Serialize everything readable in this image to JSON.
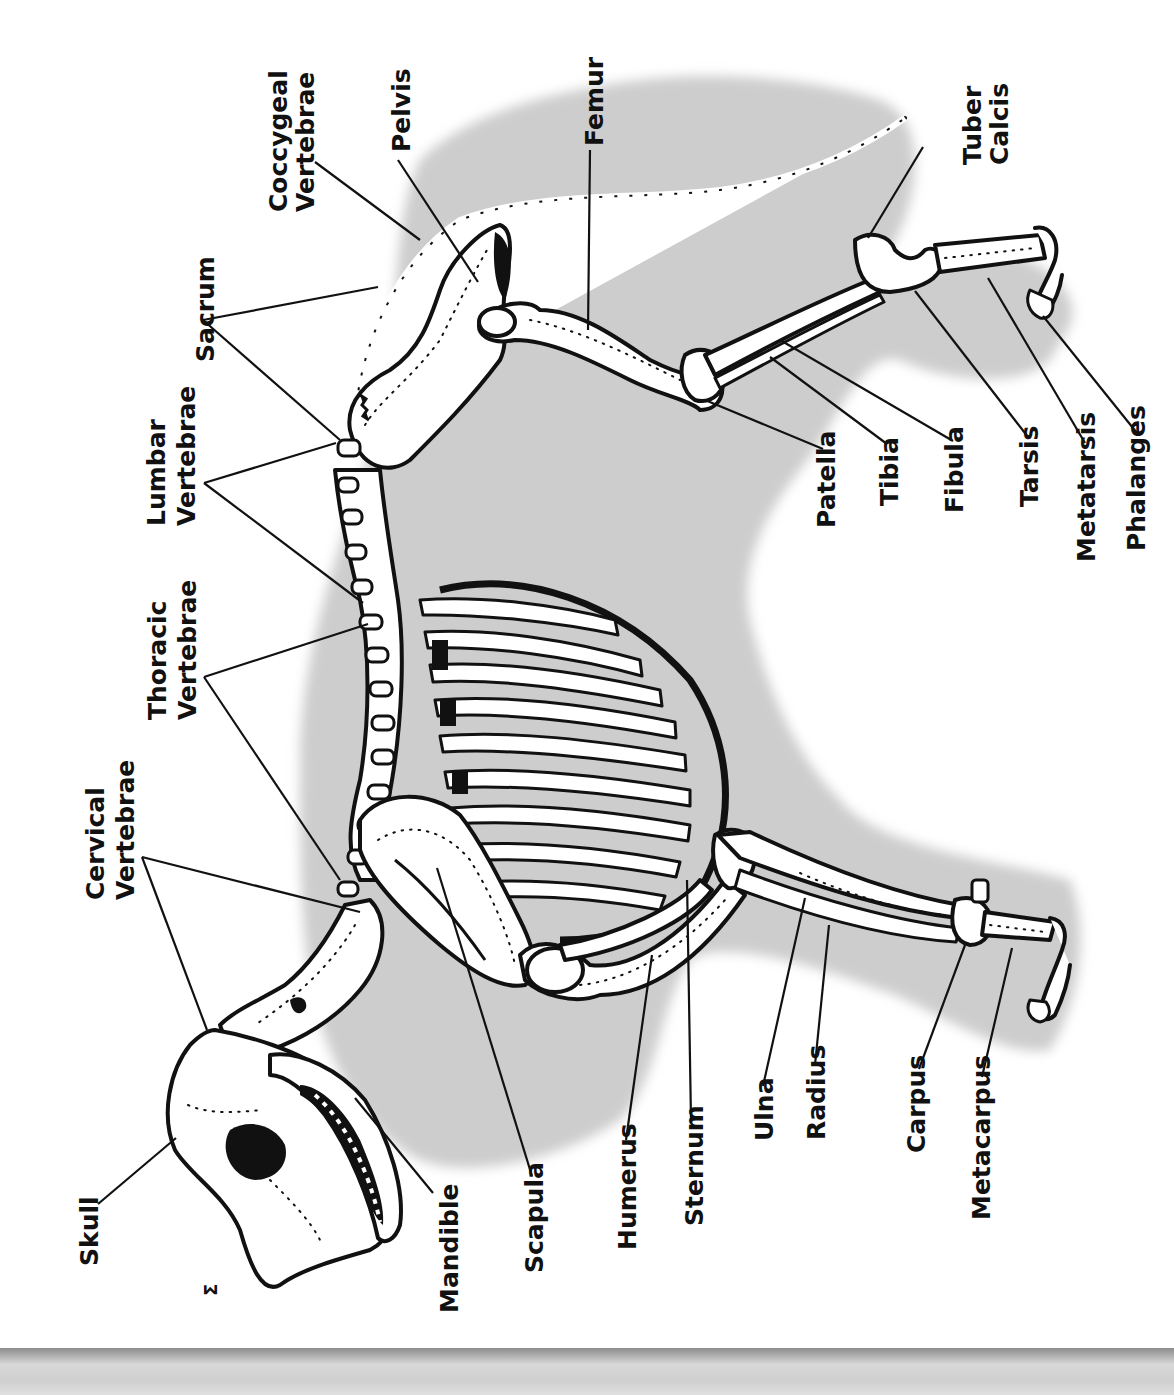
{
  "diagram": {
    "orientation_degrees": -90,
    "colors": {
      "background": "#ffffff",
      "silhouette": "#cfcfcf",
      "bone_fill": "#ffffff",
      "outline": "#111111",
      "footer_band": "#bdbdbd"
    },
    "labels": {
      "coccygeal_vertebrae": [
        "Coccygeal",
        "Vertebrae"
      ],
      "pelvis": "Pelvis",
      "femur": "Femur",
      "tuber_calcis": [
        "Tuber",
        "Calcis"
      ],
      "sacrum": "Sacrum",
      "lumbar_vertebrae": [
        "Lumbar",
        "Vertebrae"
      ],
      "thoracic_vertebrae": [
        "Thoracic",
        "Vertebrae"
      ],
      "cervical_vertebrae": [
        "Cervical",
        "Vertebrae"
      ],
      "skull": "Skull",
      "mandible": "Mandible",
      "scapula": "Scapula",
      "humerus": "Humerus",
      "sternum": "Sternum",
      "ulna": "Ulna",
      "radius": "Radius",
      "carpus": "Carpus",
      "metacarpus": "Metacarpus",
      "patella": "Patella",
      "tibia": "Tibia",
      "fibula": "Fibula",
      "tarsis": "Tarsis",
      "metatarsis": "Metatarsis",
      "phalanges": "Phalanges"
    },
    "page_number": "Σ"
  }
}
